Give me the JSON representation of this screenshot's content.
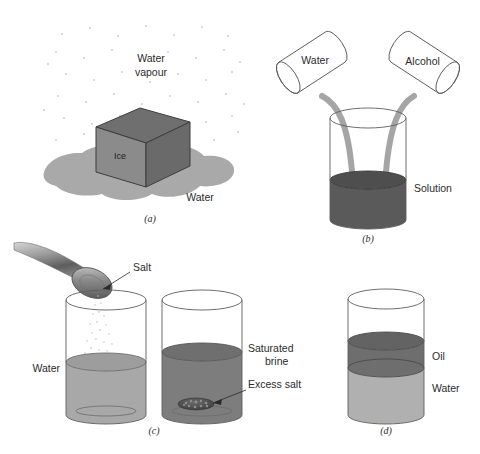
{
  "figure": {
    "background": "#ffffff"
  },
  "colors": {
    "vapour_dot": "#c9c9c9",
    "puddle": "#a9a9a9",
    "cube_top": "#6f6f6f",
    "cube_left": "#8b8b8b",
    "cube_right": "#6a6a6a",
    "cube_stroke": "#3d3d3d",
    "stream": "#a5a5a5",
    "solution": "#5a5a5a",
    "water_light": "#a8a8a8",
    "brine_dark": "#7d7d7d",
    "oil": "#6e6e6e",
    "water_d": "#b0b0b0",
    "glass_stroke": "#5d5d5d",
    "text": "#2b2b2b",
    "salt_grain": "#bdbdbd",
    "excess_salt": "#4a4a4a",
    "spoon_light": "#cfcfcf",
    "spoon_dark": "#5e5e5e"
  },
  "panels": [
    {
      "id": "a",
      "label": "(a)",
      "caption": "Ice melting to water and evaporating to water vapour",
      "labels": {
        "vapour_line1": "Water",
        "vapour_line2": "vapour",
        "solid": "Ice",
        "liquid": "Water"
      }
    },
    {
      "id": "b",
      "label": "(b)",
      "caption": "Water and alcohol poured together forming a solution",
      "labels": {
        "left_cylinder": "Water",
        "right_cylinder": "Alcohol",
        "beaker_contents": "Solution"
      }
    },
    {
      "id": "c",
      "label": "(c)",
      "caption": "Salt added to water until saturated brine with excess salt",
      "labels": {
        "spoon_contents": "Salt",
        "left_beaker": "Water",
        "right_beaker_line1": "Saturated",
        "right_beaker_line2": "brine",
        "sediment": "Excess salt"
      }
    },
    {
      "id": "d",
      "label": "(d)",
      "caption": "Immiscible oil layer floating on water",
      "labels": {
        "top_layer": "Oil",
        "bottom_layer": "Water"
      }
    }
  ]
}
